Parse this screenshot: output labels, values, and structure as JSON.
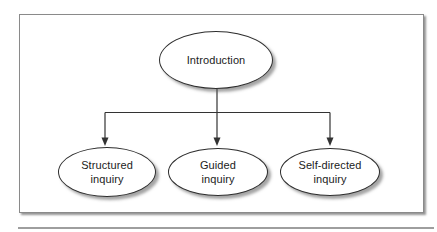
{
  "figure": {
    "type": "flowchart",
    "nodes": {
      "root": {
        "id": "introduction",
        "label": "Introduction"
      },
      "children": [
        {
          "id": "structured-inquiry",
          "label": "Structured inquiry"
        },
        {
          "id": "guided-inquiry",
          "label": "Guided inquiry"
        },
        {
          "id": "self-directed-inquiry",
          "label": "Self-directed inquiry"
        }
      ]
    },
    "edges": [
      {
        "from": "introduction",
        "to": "structured-inquiry"
      },
      {
        "from": "introduction",
        "to": "guided-inquiry"
      },
      {
        "from": "introduction",
        "to": "self-directed-inquiry"
      }
    ],
    "colors": {
      "background": "#ffffff",
      "node_fill": "#ffffff",
      "node_border": "#2e2e2e",
      "connector": "#333333",
      "frame_border": "#8a8a8a",
      "shadow": "#9e9e9e",
      "bottom_rule": "#9e9e9e"
    }
  }
}
